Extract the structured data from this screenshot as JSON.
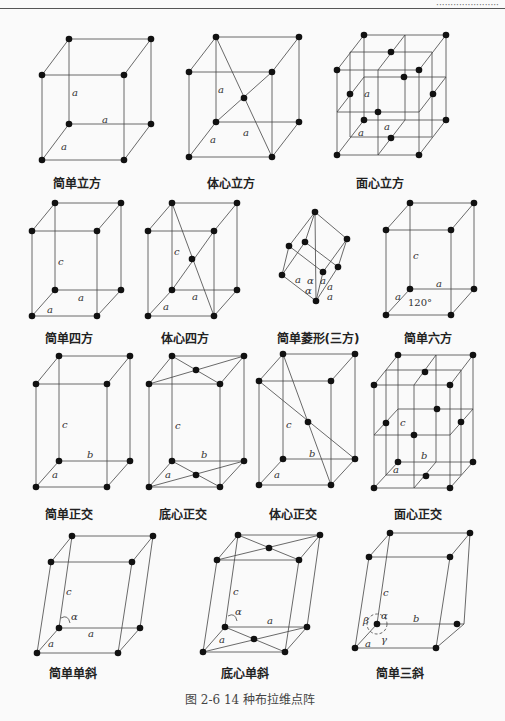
{
  "header": {
    "running_head": "······················"
  },
  "figure": {
    "caption": "图 2-6   14 种布拉维点阵",
    "lattices": [
      {
        "name": "简单立方",
        "cx": 77,
        "cy": 181
      },
      {
        "name": "体心立方",
        "cx": 231,
        "cy": 181
      },
      {
        "name": "面心立方",
        "cx": 380,
        "cy": 181
      },
      {
        "name": "简单四方",
        "cx": 69,
        "cy": 336
      },
      {
        "name": "体心四方",
        "cx": 185,
        "cy": 336
      },
      {
        "name": "简单菱形(三方)",
        "cx": 318,
        "cy": 336
      },
      {
        "name": "简单六方",
        "cx": 428,
        "cy": 336
      },
      {
        "name": "简单正交",
        "cx": 69,
        "cy": 511
      },
      {
        "name": "底心正交",
        "cx": 183,
        "cy": 511
      },
      {
        "name": "体心正交",
        "cx": 293,
        "cy": 511
      },
      {
        "name": "面心正交",
        "cx": 418,
        "cy": 511
      },
      {
        "name": "简单单斜",
        "cx": 73,
        "cy": 671
      },
      {
        "name": "底心单斜",
        "cx": 245,
        "cy": 671
      },
      {
        "name": "简单三斜",
        "cx": 400,
        "cy": 671
      }
    ],
    "axis_labels": {
      "a": "a",
      "b": "b",
      "c": "c",
      "alpha": "α",
      "beta": "β",
      "gamma": "γ",
      "angle_120": "120°"
    }
  }
}
